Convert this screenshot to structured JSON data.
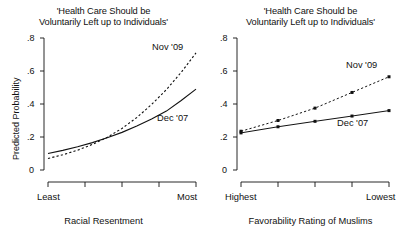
{
  "figure": {
    "width": 414,
    "height": 238,
    "background": "#ffffff",
    "ink_color": "#111111"
  },
  "chart_data": [
    {
      "panel": "left",
      "type": "line",
      "title": "'Health Care Should be\nVoluntarily Left up to Individuals'",
      "xlabel": "Racial Resentment",
      "ylabel": "Predicted Probability",
      "ylim": [
        0,
        0.8
      ],
      "yticks": [
        0,
        0.2,
        0.4,
        0.6,
        0.8
      ],
      "ytick_labels": [
        "0",
        ".2",
        ".4",
        ".6",
        ".8"
      ],
      "xlim": [
        0,
        1
      ],
      "xticks": [
        0,
        0.25,
        0.5,
        0.75,
        1
      ],
      "xtick_labels": [
        "Least",
        "",
        "",
        "",
        "Most"
      ],
      "grid": false,
      "legend": "inline-annotations",
      "series": [
        {
          "name": "Dec '07",
          "style": "solid",
          "x": [
            0.0,
            0.1,
            0.2,
            0.3,
            0.4,
            0.5,
            0.6,
            0.7,
            0.8,
            0.9,
            1.0
          ],
          "values": [
            0.1,
            0.119,
            0.141,
            0.166,
            0.195,
            0.228,
            0.266,
            0.309,
            0.357,
            0.421,
            0.49
          ]
        },
        {
          "name": "Nov '09",
          "style": "dashed",
          "x": [
            0.0,
            0.1,
            0.2,
            0.3,
            0.4,
            0.5,
            0.6,
            0.7,
            0.8,
            0.9,
            1.0
          ],
          "values": [
            0.07,
            0.092,
            0.12,
            0.155,
            0.198,
            0.252,
            0.318,
            0.397,
            0.487,
            0.592,
            0.71
          ]
        }
      ]
    },
    {
      "panel": "right",
      "type": "line",
      "title": "'Health Care Should be\nVoluntarily Left up to Individuals'",
      "xlabel": "Favorability Rating of Muslims",
      "ylabel": "",
      "ylim": [
        0,
        0.8
      ],
      "yticks": [
        0,
        0.2,
        0.4,
        0.6,
        0.8
      ],
      "ytick_labels": [
        "0",
        ".2",
        ".4",
        ".6",
        ".8"
      ],
      "xlim": [
        0,
        4
      ],
      "xticks": [
        0,
        1,
        2,
        3,
        4
      ],
      "xtick_labels": [
        "Highest",
        "",
        "",
        "",
        "Lowest"
      ],
      "grid": false,
      "markers": "filled-square",
      "legend": "inline-annotations",
      "series": [
        {
          "name": "Dec '07",
          "style": "solid",
          "x": [
            0,
            1,
            2,
            3,
            4
          ],
          "values": [
            0.225,
            0.262,
            0.295,
            0.327,
            0.36
          ]
        },
        {
          "name": "Nov '09",
          "style": "dashed",
          "x": [
            0,
            1,
            2,
            3,
            4
          ],
          "values": [
            0.235,
            0.3,
            0.375,
            0.47,
            0.565
          ]
        }
      ]
    }
  ],
  "left_panel": {
    "title": "'Health Care Should be\nVoluntarily Left up to Individuals'",
    "ylabel": "Predicted Probability",
    "xlabel": "Racial Resentment",
    "ytick_labels": [
      "0",
      ".2",
      ".4",
      ".6",
      ".8"
    ],
    "xtick_start": "Least",
    "xtick_end": "Most",
    "label_nov": "Nov '09",
    "label_dec": "Dec '07"
  },
  "right_panel": {
    "title": "'Health Care Should be\nVoluntarily Left up to Individuals'",
    "ylabel": "",
    "xlabel": "Favorability Rating of Muslims",
    "ytick_labels": [
      "0",
      ".2",
      ".4",
      ".6",
      ".8"
    ],
    "xtick_start": "Highest",
    "xtick_end": "Lowest",
    "label_nov": "Nov '09",
    "label_dec": "Dec '07"
  }
}
